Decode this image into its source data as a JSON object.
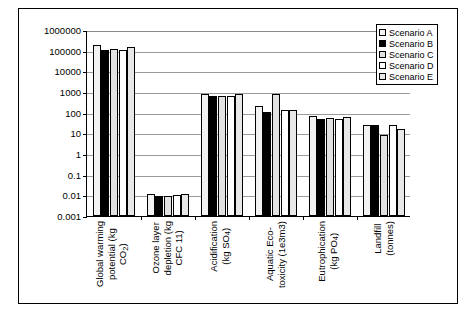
{
  "chart_data": {
    "type": "bar",
    "title": "",
    "xlabel": "",
    "ylabel": "",
    "yscale": "log",
    "ylim": [
      0.001,
      1000000
    ],
    "grid": true,
    "legend_position": "top-right",
    "ytick_labels": [
      "1000000",
      "100000",
      "10000",
      "1000",
      "100",
      "10",
      "1",
      "0.1",
      "0.01",
      "0.001"
    ],
    "ytick_values": [
      1000000,
      100000,
      10000,
      1000,
      100,
      10,
      1,
      0.1,
      0.01,
      0.001
    ],
    "categories": [
      "Global warming potential (kg CO2)",
      "Ozone layer depletion (kg CFC 11)",
      "Acidification (kg SO4)",
      "Aquatic Eco-toxicity (1e3m3)",
      "Eutrophication (kg PO4)",
      "Landfill (tonnes)"
    ],
    "series": [
      {
        "name": "Scenario A",
        "values": [
          180000,
          0.012,
          800,
          200,
          70,
          25
        ]
      },
      {
        "name": "Scenario B",
        "values": [
          105000,
          0.0095,
          620,
          110,
          48,
          24
        ]
      },
      {
        "name": "Scenario C",
        "values": [
          120000,
          0.0092,
          650,
          800,
          55,
          8
        ]
      },
      {
        "name": "Scenario D",
        "values": [
          110000,
          0.0105,
          640,
          130,
          52,
          25
        ]
      },
      {
        "name": "Scenario E",
        "values": [
          150000,
          0.012,
          760,
          140,
          60,
          17
        ]
      }
    ]
  },
  "axis": {
    "categories_display": [
      "Global warming\npotential (kg\nCO",
      "Ozone layer\ndepletion (kg\nCFC 11)",
      "Acidification\n(kg SO",
      "Aquatic Eco-\ntoxicity (1e3m3)",
      "Eutrophication\n(kg PO",
      "Landfill\n(tonnes)"
    ]
  },
  "legend": {
    "items": [
      {
        "label": "Scenario A",
        "style": "dotted-light"
      },
      {
        "label": "Scenario B",
        "style": "solid-black"
      },
      {
        "label": "Scenario C",
        "style": "dotted-gray"
      },
      {
        "label": "Scenario D",
        "style": "white"
      },
      {
        "label": "Scenario E",
        "style": "light-gray"
      }
    ]
  },
  "colors": {
    "axis": "#000000",
    "grid": "#9a9a9a",
    "series_b": "#000000",
    "background": "#ffffff"
  }
}
